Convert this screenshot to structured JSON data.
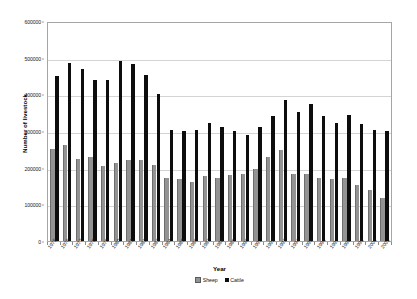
{
  "chart_data": {
    "type": "bar",
    "title": "",
    "xlabel": "Year",
    "ylabel": "Number of livestock",
    "ylim": [
      0,
      600000
    ],
    "ytick_values": [
      0,
      100000,
      200000,
      300000,
      400000,
      500000,
      600000
    ],
    "ytick_labels": [
      "0",
      "100000",
      "200000",
      "300000",
      "400000",
      "500000",
      "600000"
    ],
    "grid": true,
    "legend_position": "bottom",
    "categories": [
      "1975",
      "1976",
      "1977",
      "1978",
      "1979",
      "1980",
      "1981",
      "1982",
      "1983",
      "1984",
      "1985",
      "1986",
      "1987",
      "1988",
      "1989",
      "1990",
      "1991",
      "1992",
      "1993",
      "1994",
      "1995",
      "1996",
      "1997",
      "1998",
      "1999",
      "2000",
      "2001"
    ],
    "series": [
      {
        "name": "Sheep",
        "color": "#939393",
        "values": [
          250000,
          262000,
          225000,
          228000,
          205000,
          212000,
          222000,
          220000,
          208000,
          172000,
          168000,
          162000,
          178000,
          172000,
          180000,
          182000,
          196000,
          228000,
          248000,
          183000,
          184000,
          172000,
          170000,
          173000,
          152000,
          138000,
          118000
        ]
      },
      {
        "name": "Cattle",
        "color": "#0d0d0d",
        "values": [
          450000,
          485000,
          470000,
          440000,
          440000,
          492000,
          482000,
          452000,
          402000,
          302000,
          301000,
          302000,
          322000,
          310000,
          300000,
          290000,
          312000,
          340000,
          385000,
          352000,
          375000,
          340000,
          322000,
          345000,
          318000,
          302000,
          300000
        ]
      }
    ]
  },
  "legend": {
    "items": [
      {
        "label": "Sheep",
        "key": "sheep"
      },
      {
        "label": "Cattle",
        "key": "cattle"
      }
    ]
  }
}
